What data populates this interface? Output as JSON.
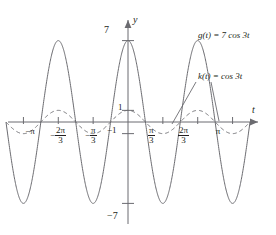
{
  "figure": {
    "axes": {
      "y_axis_label": "y",
      "t_axis_label": "t",
      "y_ticks": [
        {
          "label": "7",
          "value": 7
        },
        {
          "label": "1",
          "value": 1
        },
        {
          "label": "−1",
          "value": -1
        },
        {
          "label": "−7",
          "value": -7
        }
      ],
      "x_ticks": [
        {
          "label": "−π",
          "value_pi": -1,
          "num": "",
          "den": ""
        },
        {
          "label": "−2π/3",
          "value_pi": -0.6666667,
          "sign": "−",
          "num": "2π",
          "den": "3"
        },
        {
          "label": "−π/3",
          "value_pi": -0.3333333,
          "sign": "−",
          "num": "π",
          "den": "3"
        },
        {
          "label": "π/3",
          "value_pi": 0.3333333,
          "sign": "",
          "num": "π",
          "den": "3"
        },
        {
          "label": "2π/3",
          "value_pi": 0.6666667,
          "sign": "",
          "num": "2π",
          "den": "3"
        },
        {
          "label": "π",
          "value_pi": 1,
          "num": "",
          "den": ""
        }
      ]
    },
    "annotations": {
      "g_label": "g(t) = 7 cos 3t",
      "g_label_parts": {
        "fn": "g",
        "arg": "(t)",
        "eq": " = 7 cos 3",
        "var": "t"
      },
      "k_label": "k(t) = cos 3t",
      "k_label_parts": {
        "fn": "k",
        "arg": "(t)",
        "eq": " = cos 3",
        "var": "t"
      }
    }
  },
  "chart_data": {
    "type": "line",
    "title": "",
    "xlabel": "t",
    "ylabel": "y",
    "xlim": [
      -3.665,
      3.665
    ],
    "ylim": [
      -8.6,
      8.6
    ],
    "grid": false,
    "legend": "inline-annotations",
    "x_tick_labels": [
      "−π",
      "−2π/3",
      "−π/3",
      "π/3",
      "2π/3",
      "π"
    ],
    "x_tick_values": [
      -3.14159,
      -2.0944,
      -1.0472,
      1.0472,
      2.0944,
      3.14159
    ],
    "y_tick_labels": [
      "7",
      "1",
      "−1",
      "−7"
    ],
    "y_tick_values": [
      7,
      1,
      -1,
      -7
    ],
    "series": [
      {
        "name": "g(t) = 7 cos 3t",
        "expression": "7*cos(3*t)",
        "amplitude": 7,
        "period": 2.0944,
        "style": "solid",
        "color": "#6b6b70"
      },
      {
        "name": "k(t) = cos 3t",
        "expression": "cos(3*t)",
        "amplitude": 1,
        "period": 2.0944,
        "style": "dashed",
        "color": "#6b6b70"
      }
    ]
  }
}
